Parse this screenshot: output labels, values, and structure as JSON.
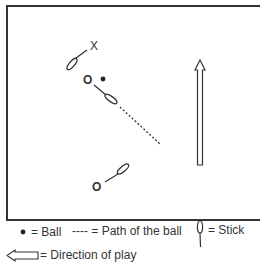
{
  "diagram": {
    "players": [
      {
        "symbol": "X",
        "team": "opponent"
      },
      {
        "symbol": "O",
        "team": "attacker-with-ball"
      },
      {
        "symbol": "O",
        "team": "attacker-receiver"
      }
    ],
    "markers": {
      "x_label": "X",
      "o1_label": "O",
      "o2_label": "O"
    }
  },
  "legend": {
    "ball_label": "= Ball",
    "path_label": "---- = Path of the ball",
    "path_dashes": "----",
    "path_text": "= Path of the ball",
    "stick_label": "= Stick",
    "direction_label": "= Direction of play"
  },
  "colors": {
    "ink": "#333333",
    "background": "#ffffff"
  }
}
